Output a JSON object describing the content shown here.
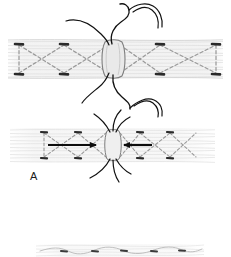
{
  "figure": {
    "background_color": "#ffffff",
    "width": 231,
    "height": 257,
    "panels": [
      {
        "id": "panel-top",
        "label": "",
        "description": "Tendon segment with cross-stitch (X) suture pattern and curved needles at repair site",
        "tendon": {
          "x": 8,
          "y": 40,
          "width": 215,
          "height": 38,
          "fill_color": "#f2f2f2",
          "fiber_color": "#dcdcdc",
          "fiber_count": 11
        },
        "repair_site": {
          "cx": 113,
          "cy": 59,
          "rx": 9,
          "ry": 19,
          "fill_color": "#e8e8e8",
          "stroke_color": "#8a8a8a"
        },
        "anchor_points": [
          {
            "x": 19,
            "y": 44
          },
          {
            "x": 64,
            "y": 44
          },
          {
            "x": 64,
            "y": 74
          },
          {
            "x": 19,
            "y": 74
          },
          {
            "x": 160,
            "y": 44
          },
          {
            "x": 160,
            "y": 74
          },
          {
            "x": 216,
            "y": 44
          },
          {
            "x": 216,
            "y": 74
          }
        ],
        "suture_color": "#9a9a9a",
        "needles": [
          {
            "position": "top-left",
            "description": "curved needle with thread entering repair site from upper left"
          },
          {
            "position": "top-right",
            "description": "curved needle arcing above repair site to the right"
          },
          {
            "position": "bottom-left",
            "description": "curved needle with thread exiting repair site below left"
          },
          {
            "position": "bottom-right",
            "description": "curved needle arcing below repair site to the right"
          }
        ],
        "needle_color": "#1a1a1a"
      },
      {
        "id": "panel-a",
        "label": "A",
        "label_x": 30,
        "label_y": 176,
        "description": "Tendon repair under tension; arrows indicate approximation forces drawing tendon ends together",
        "tendon": {
          "x": 10,
          "y": 128,
          "width": 205,
          "height": 34,
          "fill_color": "#f4f4f4",
          "fiber_color": "#e0e0e0",
          "fiber_count": 10
        },
        "repair_site": {
          "cx": 113,
          "cy": 145,
          "rx": 7,
          "ry": 16,
          "fill_color": "#ededed",
          "stroke_color": "#8a8a8a"
        },
        "anchor_points": [
          {
            "x": 44,
            "y": 132
          },
          {
            "x": 78,
            "y": 132
          },
          {
            "x": 78,
            "y": 158
          },
          {
            "x": 44,
            "y": 158
          },
          {
            "x": 140,
            "y": 132
          },
          {
            "x": 140,
            "y": 158
          },
          {
            "x": 170,
            "y": 132
          },
          {
            "x": 170,
            "y": 158
          }
        ],
        "suture_color": "#9a9a9a",
        "arrows": [
          {
            "direction": "right",
            "x1": 48,
            "y1": 145,
            "x2": 98,
            "y2": 145,
            "color": "#0d0d0d"
          },
          {
            "direction": "left",
            "x1": 152,
            "y1": 145,
            "x2": 122,
            "y2": 145,
            "color": "#0d0d0d"
          }
        ],
        "threads": [
          {
            "position": "top",
            "description": "suture tails rising from repair site"
          },
          {
            "position": "bottom",
            "description": "suture tails descending from repair site"
          }
        ],
        "thread_color": "#1a1a1a"
      },
      {
        "id": "panel-bottom",
        "label": "",
        "description": "Partially visible third panel at lower edge showing flattened tendon with running suture knots",
        "tendon": {
          "x": 34,
          "y": 244,
          "width": 172,
          "height": 13,
          "fill_color": "#fafafa",
          "fiber_color": "#e4e4e4",
          "fiber_count": 4
        },
        "knots": [
          {
            "x": 64,
            "y": 251
          },
          {
            "x": 95,
            "y": 251
          },
          {
            "x": 124,
            "y": 251
          },
          {
            "x": 154,
            "y": 251
          },
          {
            "x": 182,
            "y": 251
          }
        ],
        "knot_color": "#3a3a3a",
        "suture_color": "#c0c0c0"
      }
    ]
  }
}
